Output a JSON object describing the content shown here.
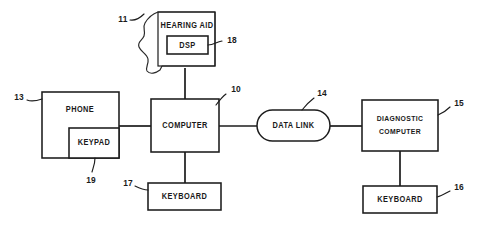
{
  "figure": {
    "type": "patent-block-diagram",
    "background_color": "#ffffff",
    "line_color": "#1c1c1c",
    "width": 483,
    "height": 229
  },
  "nodes": {
    "hearing_aid": {
      "label": "HEARING AID",
      "ref": "11",
      "shape": "ear-shell"
    },
    "dsp": {
      "label": "DSP",
      "ref": "18",
      "shape": "rect"
    },
    "phone": {
      "label": "PHONE",
      "ref": "13",
      "shape": "rect"
    },
    "keypad": {
      "label": "KEYPAD",
      "ref": "19",
      "shape": "rect"
    },
    "computer": {
      "label": "COMPUTER",
      "ref": "10",
      "shape": "rect"
    },
    "keyboard_local": {
      "label": "KEYBOARD",
      "ref": "17",
      "shape": "rect"
    },
    "data_link": {
      "label": "DATA LINK",
      "ref": "14",
      "shape": "stadium"
    },
    "diagnostic_computer": {
      "label_line1": "DIAGNOSTIC",
      "label_line2": "COMPUTER",
      "ref": "15",
      "shape": "rect"
    },
    "keyboard_remote": {
      "label": "KEYBOARD",
      "ref": "16",
      "shape": "rect"
    }
  },
  "connections": [
    {
      "from": "hearing_aid",
      "to": "computer",
      "orientation": "vertical"
    },
    {
      "from": "phone",
      "to": "computer",
      "orientation": "horizontal"
    },
    {
      "from": "computer",
      "to": "keyboard_local",
      "orientation": "vertical"
    },
    {
      "from": "computer",
      "to": "data_link",
      "orientation": "horizontal"
    },
    {
      "from": "data_link",
      "to": "diagnostic_computer",
      "orientation": "horizontal"
    },
    {
      "from": "diagnostic_computer",
      "to": "keyboard_remote",
      "orientation": "vertical"
    }
  ]
}
